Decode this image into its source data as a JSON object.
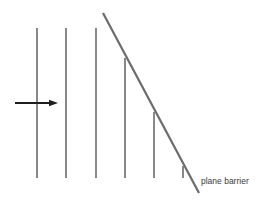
{
  "diagram": {
    "label": "plane barrier",
    "colors": {
      "wavefront": "#3a3a3a",
      "barrier": "#6b6b6b",
      "arrow": "#1e1e1e",
      "text": "#3a3a3a"
    },
    "wavefronts": [
      {
        "x": 37,
        "y_top": 28,
        "y_bottom": 178
      },
      {
        "x": 66,
        "y_top": 28,
        "y_bottom": 178
      },
      {
        "x": 96,
        "y_top": 28,
        "y_bottom": 178
      },
      {
        "x": 125,
        "y_top": 58,
        "y_bottom": 178
      },
      {
        "x": 154,
        "y_top": 112,
        "y_bottom": 178
      },
      {
        "x": 183,
        "y_top": 166,
        "y_bottom": 178
      }
    ],
    "barrier": {
      "x1": 103,
      "y1": 13,
      "x2": 199,
      "y2": 193
    },
    "arrow": {
      "x1": 15,
      "y1": 103,
      "x2": 58,
      "y2": 103,
      "direction": "right"
    }
  }
}
